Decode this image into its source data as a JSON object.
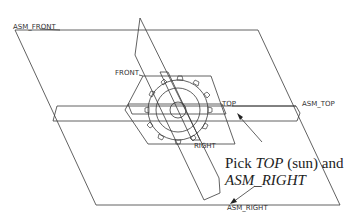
{
  "labels": {
    "asm_front": "ASM_FRONT",
    "front": "FRONT",
    "top": "TOP",
    "asm_top": "ASM_TOP",
    "right": "RIGHT",
    "asm_right": "ASM_RIGHT"
  },
  "annotation": {
    "pick": "Pick ",
    "top_italic": "TOP",
    "sun": " (sun) and",
    "asm_right_italic": "ASM_RIGHT"
  },
  "colors": {
    "line": "#3a3a3a",
    "background": "#ffffff"
  }
}
